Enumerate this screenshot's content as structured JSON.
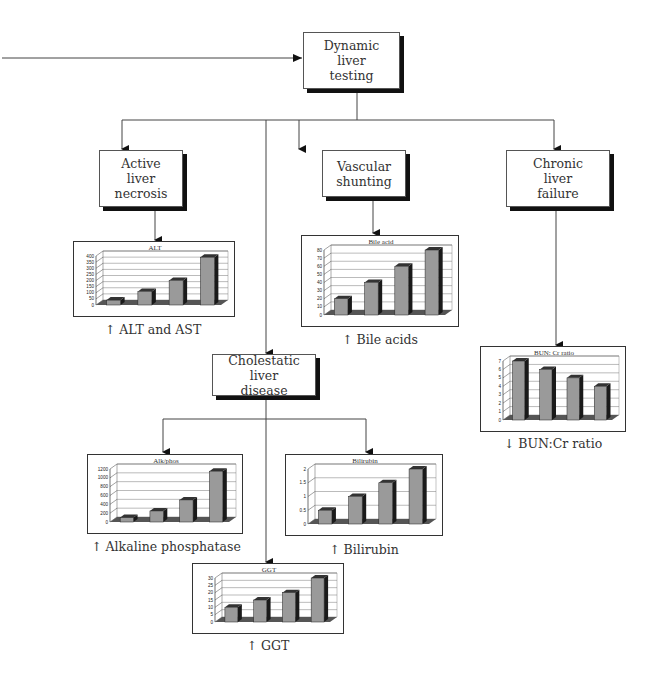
{
  "diagram": {
    "root": {
      "label": "Dynamic\nliver\ntesting"
    },
    "branches": [
      {
        "id": "necrosis",
        "label": "Active\nliver\nnecrosis"
      },
      {
        "id": "shunting",
        "label": "Vascular\nshunting"
      },
      {
        "id": "failure",
        "label": "Chronic\nliver\nfailure"
      },
      {
        "id": "cholestatic",
        "label": "Cholestatic liver\ndisease"
      }
    ],
    "captions": {
      "alt": "↑ ALT and AST",
      "bile": "↑ Bile acids",
      "bun": "↓ BUN:Cr ratio",
      "alkphos": "↑ Alkaline phosphatase",
      "bilirubin": "↑ Bilirubin",
      "ggt": "↑ GGT"
    },
    "colors": {
      "line": "#444444",
      "bar": "#9a9a9a",
      "bar_side": "#1a1a1a",
      "floor": "#555555",
      "shadow": "#111111"
    }
  },
  "chart_data": [
    {
      "id": "alt",
      "type": "bar",
      "title": "ALT",
      "categories": [
        "1",
        "2",
        "3",
        "4"
      ],
      "values": [
        40,
        110,
        200,
        390
      ],
      "ylim": [
        0,
        400
      ],
      "yticks": [
        "0",
        "50",
        "100",
        "150",
        "200",
        "250",
        "300",
        "350",
        "400"
      ],
      "grid": true,
      "style": "3d"
    },
    {
      "id": "bile",
      "type": "bar",
      "title": "Bile acid",
      "categories": [
        "1",
        "2",
        "3",
        "4"
      ],
      "values": [
        20,
        40,
        60,
        80
      ],
      "ylim": [
        0,
        80
      ],
      "yticks": [
        "0",
        "10",
        "20",
        "30",
        "40",
        "50",
        "60",
        "70",
        "80"
      ],
      "grid": true,
      "style": "3d"
    },
    {
      "id": "bun",
      "type": "bar",
      "title": "BUN: Cr ratio",
      "categories": [
        "1",
        "2",
        "3",
        "4"
      ],
      "values": [
        7,
        6,
        5,
        4
      ],
      "ylim": [
        0,
        7
      ],
      "yticks": [
        "0",
        "1",
        "2",
        "3",
        "4",
        "5",
        "6",
        "7"
      ],
      "grid": true,
      "style": "3d"
    },
    {
      "id": "alkphos",
      "type": "bar",
      "title": "Alk/phos",
      "categories": [
        "1",
        "2",
        "3",
        "4"
      ],
      "values": [
        100,
        250,
        500,
        1150
      ],
      "ylim": [
        0,
        1200
      ],
      "yticks": [
        "0",
        "200",
        "400",
        "600",
        "800",
        "1000",
        "1200"
      ],
      "grid": true,
      "style": "3d"
    },
    {
      "id": "bilirubin",
      "type": "bar",
      "title": "Bilirubin",
      "categories": [
        "1",
        "2",
        "3",
        "4"
      ],
      "values": [
        0.5,
        1,
        1.5,
        2
      ],
      "ylim": [
        0,
        2
      ],
      "yticks": [
        "0",
        "0.5",
        "1",
        "1.5",
        "2"
      ],
      "grid": true,
      "style": "3d"
    },
    {
      "id": "ggt",
      "type": "bar",
      "title": "GGT",
      "categories": [
        "1",
        "2",
        "3",
        "4"
      ],
      "values": [
        10,
        15,
        20,
        30
      ],
      "ylim": [
        0,
        30
      ],
      "yticks": [
        "0",
        "5",
        "10",
        "15",
        "20",
        "25",
        "30"
      ],
      "grid": true,
      "style": "3d"
    }
  ]
}
